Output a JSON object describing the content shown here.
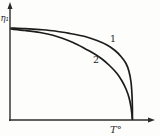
{
  "figure": {
    "kind": "textbook-physics-plot",
    "background": "#fdfdfc"
  },
  "chart_data": {
    "type": "line",
    "title": "",
    "xlabel": "T°",
    "ylabel": "η₁",
    "legend": "none",
    "grid": false,
    "axes_style": "arrowed, unlabeled ticks (qualitative plot)",
    "coordinate_space": "svg_px_160x136_y_down",
    "axis_color": "#2b2b2b",
    "curve_color": "#1c1c1c",
    "axis_stroke_width": 1.4,
    "curve_stroke_width": 1.7,
    "axes": {
      "origin": [
        10,
        120
      ],
      "x_tip": [
        155,
        120
      ],
      "y_tip": [
        10,
        2
      ],
      "arrow_len": 7,
      "arrow_half_w": 2.5
    },
    "labels": {
      "ylabel_pos": [
        0.5,
        21
      ],
      "ylabel_size": 8.5,
      "xlabel_pos": [
        110,
        132.5
      ],
      "xlabel_size": 10
    },
    "series": [
      {
        "name": "1",
        "label_pos": [
          113,
          41.5
        ],
        "label_size": 9.5,
        "points": [
          [
            11,
            28
          ],
          [
            25,
            28.6
          ],
          [
            40,
            29.6
          ],
          [
            55,
            31
          ],
          [
            70,
            33.5
          ],
          [
            85,
            36.5
          ],
          [
            97,
            40.5
          ],
          [
            107,
            45
          ],
          [
            115,
            50.5
          ],
          [
            121,
            56.5
          ],
          [
            126,
            63.5
          ],
          [
            129,
            71.5
          ],
          [
            131,
            82
          ],
          [
            132,
            95
          ],
          [
            132.4,
            108
          ],
          [
            132.4,
            119
          ]
        ]
      },
      {
        "name": "2",
        "label_pos": [
          96,
          62.5
        ],
        "label_size": 9.5,
        "points": [
          [
            11,
            29
          ],
          [
            25,
            30.5
          ],
          [
            40,
            32.5
          ],
          [
            52,
            35
          ],
          [
            63,
            38.5
          ],
          [
            73,
            42.5
          ],
          [
            83,
            47.5
          ],
          [
            93,
            53
          ],
          [
            102,
            59
          ],
          [
            110,
            66
          ],
          [
            117,
            73.5
          ],
          [
            122,
            81
          ],
          [
            126,
            89
          ],
          [
            129,
            97.5
          ],
          [
            131,
            107
          ],
          [
            132.4,
            119
          ]
        ]
      }
    ]
  }
}
